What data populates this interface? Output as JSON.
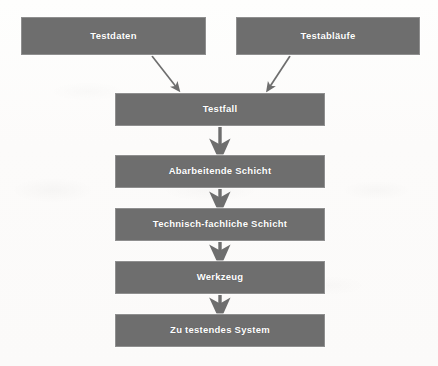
{
  "diagram": {
    "colors": {
      "node_fill": "#6e6e6e",
      "node_border": "#8f8f8f",
      "node_text": "#ffffff",
      "arrow": "#6e6e6e",
      "background": "#fdfdfc"
    },
    "inputs": [
      {
        "id": "testdaten",
        "label": "Testdaten"
      },
      {
        "id": "testablaeufe",
        "label": "Testabläufe"
      }
    ],
    "layers": [
      {
        "id": "testfall",
        "label": "Testfall"
      },
      {
        "id": "abarbeitende",
        "label": "Abarbeitende Schicht"
      },
      {
        "id": "technisch",
        "label": "Technisch-fachliche Schicht"
      },
      {
        "id": "werkzeug",
        "label": "Werkzeug"
      },
      {
        "id": "system",
        "label": "Zu testendes System"
      }
    ],
    "edges": [
      {
        "from": "testdaten",
        "to": "testfall",
        "style": "diagonal-arrow"
      },
      {
        "from": "testablaeufe",
        "to": "testfall",
        "style": "diagonal-arrow"
      },
      {
        "from": "testfall",
        "to": "abarbeitende",
        "style": "vertical-arrow"
      },
      {
        "from": "abarbeitende",
        "to": "technisch",
        "style": "vertical-arrow"
      },
      {
        "from": "technisch",
        "to": "werkzeug",
        "style": "vertical-arrow"
      },
      {
        "from": "werkzeug",
        "to": "system",
        "style": "vertical-arrow"
      }
    ]
  }
}
